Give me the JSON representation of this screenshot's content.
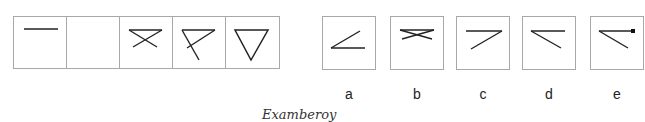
{
  "sequence": {
    "cells": [
      {
        "id": 1,
        "figure": "horizontal-line"
      },
      {
        "id": 2,
        "figure": "blank"
      },
      {
        "id": 3,
        "figure": "horizontal-line-with-x-cross"
      },
      {
        "id": 4,
        "figure": "horizontal-line-with-diagonals"
      },
      {
        "id": 5,
        "figure": "inverted-triangle"
      }
    ]
  },
  "options": [
    {
      "label": "a",
      "figure": "angle-opening-right-bottom"
    },
    {
      "label": "b",
      "figure": "horizontal-line-with-flat-x"
    },
    {
      "label": "c",
      "figure": "horizontal-line-with-diagonal-down-left"
    },
    {
      "label": "d",
      "figure": "horizontal-line-with-diagonal-down-right"
    },
    {
      "label": "e",
      "figure": "horizontal-line-with-diagonal-and-dot"
    }
  ],
  "caption": "Examberoy"
}
